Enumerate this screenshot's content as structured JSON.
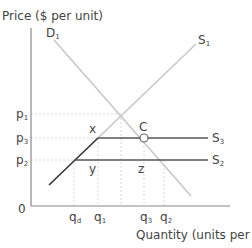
{
  "y_axis_label": "Price ($ per unit)",
  "x_axis_label": "Quantity (units per year)",
  "origin_label": "0",
  "curves": {
    "demand": "D₁",
    "supply_1": "S₁",
    "supply_3": "S₃",
    "supply_2": "S₂"
  },
  "price_ticks": [
    "p₁",
    "p₃",
    "p₂"
  ],
  "quantity_ticks": [
    "q_d",
    "q₁",
    "q₃",
    "q₂"
  ],
  "quantity_tick_labels": {
    "qd": "q",
    "qd_sub": "d",
    "q1": "q",
    "q1_sub": "1",
    "q3": "q",
    "q3_sub": "3",
    "q2": "q",
    "q2_sub": "2"
  },
  "price_tick_labels": {
    "p1": "p",
    "p1_sub": "1",
    "p3": "p",
    "p3_sub": "3",
    "p2": "p",
    "p2_sub": "2"
  },
  "point_labels": {
    "x": "x",
    "y": "y",
    "z": "z",
    "c": "C"
  },
  "colors": {
    "axis": "#777777",
    "light_line": "#c8c8c8",
    "dark_line": "#333333",
    "dashed": "#d6d6d6",
    "text": "#444444"
  }
}
